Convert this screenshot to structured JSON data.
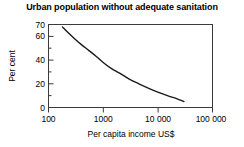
{
  "chart_data": {
    "type": "line",
    "title": "Urban population without adequate sanitation",
    "xlabel": "Per capita income US$",
    "ylabel": "Per cent",
    "xscale": "log",
    "xlim": [
      100,
      100000
    ],
    "ylim": [
      0,
      70
    ],
    "grid": false,
    "legend": null,
    "x_tick_labels": [
      "100",
      "1000",
      "10 000",
      "100 000"
    ],
    "x_tick_values": [
      100,
      1000,
      10000,
      100000
    ],
    "y_tick_labels": [
      "0",
      "20",
      "40",
      "60",
      "70"
    ],
    "y_tick_values": [
      0,
      20,
      40,
      60,
      70
    ],
    "y_minor_tick_values": [
      10,
      30,
      50
    ],
    "line_color": "#1a1a1a",
    "series": [
      {
        "name": "Urban population without adequate sanitation",
        "x": [
          180,
          230,
          300,
          400,
          550,
          750,
          1000,
          1400,
          2000,
          3000,
          4500,
          7000,
          10000,
          15000,
          22000,
          30000
        ],
        "values": [
          68,
          63,
          58,
          53,
          48,
          43,
          38,
          33,
          29,
          24,
          20,
          16,
          13,
          10,
          7.5,
          5
        ]
      }
    ]
  },
  "axes": {
    "ylabel": "Per cent",
    "xlabel": "Per capita income US$"
  },
  "title": "Urban population without adequate sanitation"
}
